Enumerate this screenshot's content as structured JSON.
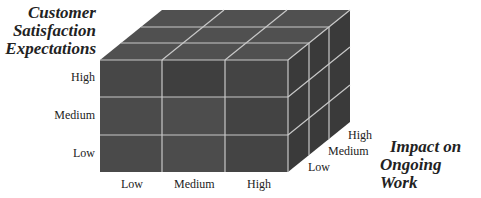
{
  "diagram": {
    "type": "3d-cube-matrix",
    "grid": "3x3x3",
    "y_axis": {
      "title_lines": [
        "Customer",
        "Satisfaction",
        "Expectations"
      ],
      "ticks": [
        "High",
        "Medium",
        "Low"
      ]
    },
    "x_axis": {
      "ticks": [
        "Low",
        "Medium",
        "High"
      ]
    },
    "z_axis": {
      "title_lines": [
        "Impact on",
        "Ongoing Work"
      ],
      "ticks": [
        "High",
        "Medium",
        "Low"
      ]
    },
    "colors": {
      "front_face": "#4a4a4a",
      "top_face": "#505050",
      "side_face": "#3c3c3c",
      "grid_lines": "#c8c8c8"
    }
  }
}
